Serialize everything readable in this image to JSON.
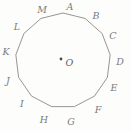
{
  "figure": {
    "kind": "regular-polygon-diagram",
    "shape_name": "tridecagon",
    "side_count": 13,
    "center_label": "O",
    "center_dot": "center-point-dot",
    "stroke_color": "#8a8987",
    "label_color": "#7c7b79",
    "background_color": "#fdfdfc",
    "canvas": {
      "width": 131,
      "height": 133
    },
    "geometry": {
      "center_x": 63,
      "center_y": 60.5,
      "radius": 47.5,
      "start_angle_deg": -90,
      "direction": "clockwise"
    },
    "vertices": [
      {
        "label": "A",
        "index": 0,
        "label_x": 70,
        "label_y": 7
      },
      {
        "label": "B",
        "index": 1,
        "label_x": 96,
        "label_y": 16
      },
      {
        "label": "C",
        "index": 2,
        "label_x": 113,
        "label_y": 36
      },
      {
        "label": "D",
        "index": 3,
        "label_x": 120,
        "label_y": 62
      },
      {
        "label": "E",
        "index": 4,
        "label_x": 114,
        "label_y": 88
      },
      {
        "label": "F",
        "index": 5,
        "label_x": 98,
        "label_y": 110
      },
      {
        "label": "G",
        "index": 6,
        "label_x": 71,
        "label_y": 122
      },
      {
        "label": "H",
        "index": 7,
        "label_x": 44,
        "label_y": 120
      },
      {
        "label": "I",
        "index": 8,
        "label_x": 22,
        "label_y": 104
      },
      {
        "label": "J",
        "index": 9,
        "label_x": 8,
        "label_y": 81
      },
      {
        "label": "K",
        "index": 10,
        "label_x": 6,
        "label_y": 52
      },
      {
        "label": "L",
        "index": 11,
        "label_x": 17,
        "label_y": 27
      },
      {
        "label": "M",
        "index": 12,
        "label_x": 42,
        "label_y": 10
      }
    ],
    "center": {
      "dot_x": 61,
      "dot_y": 59,
      "label_x": 69.5,
      "label_y": 63
    }
  }
}
